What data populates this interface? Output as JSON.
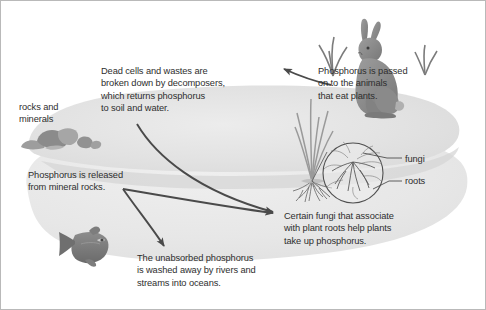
{
  "diagram": {
    "palette": {
      "text": "#2e2e2e",
      "arrow": "#4a4a4a",
      "land_light": "#e8e8e8",
      "land_mid": "#dedede",
      "land_dark": "#d2d2d2",
      "animal_gray": "#8e8e8e",
      "animal_dark": "#6f6f6f",
      "rock_gray": "#9a9a9a",
      "plant_gray": "#9e9e9e",
      "border": "#b9b9b9",
      "background": "#ffffff"
    },
    "labels": {
      "rocks_and_minerals": {
        "lines": [
          "rocks and",
          "minerals"
        ],
        "text": "rocks and\nminerals"
      },
      "decomposers": {
        "lines": [
          "Dead cells and wastes are",
          "broken down by decomposers,",
          "which returns phosphorus",
          "to soil and water."
        ],
        "text": "Dead cells and wastes are\nbroken down by decomposers,\nwhich returns phosphorus\nto soil and water."
      },
      "animals": {
        "lines": [
          "Phosphorus is passed",
          "on to the animals",
          "that eat plants."
        ],
        "text": "Phosphorus is passed\non to the animals\nthat eat plants."
      },
      "released_from_rocks": {
        "lines": [
          "Phosphorus is released",
          "from mineral rocks."
        ],
        "text": "Phosphorus is released\nfrom mineral rocks."
      },
      "fungi_association": {
        "lines": [
          "Certain fungi that associate",
          "with plant roots help plants",
          "take up phosphorus."
        ],
        "text": "Certain fungi that associate\nwith plant roots help plants\ntake up phosphorus."
      },
      "unabsorbed": {
        "lines": [
          "The unabsorbed phosphorus",
          "is washed away by rivers and",
          "streams into oceans."
        ],
        "text": "The unabsorbed phosphorus\nis washed away by rivers and\nstreams into oceans."
      },
      "callout_fungi": {
        "text": "fungi"
      },
      "callout_roots": {
        "text": "roots"
      }
    },
    "figures": [
      {
        "name": "rabbit",
        "label": "rabbit"
      },
      {
        "name": "fish",
        "label": "fish"
      },
      {
        "name": "rock-cluster",
        "label": "rocks"
      },
      {
        "name": "grass-plant",
        "label": "grass plant with roots"
      },
      {
        "name": "magnifier",
        "label": "root and fungi magnification circle"
      },
      {
        "name": "grass-tuft-left",
        "label": "grass tuft"
      },
      {
        "name": "grass-tuft-right",
        "label": "grass tuft"
      }
    ],
    "arrows": [
      {
        "name": "decomposers-to-roots",
        "from": "decomposers text",
        "to": "plant roots"
      },
      {
        "name": "rocks-to-roots",
        "from": "mineral rocks",
        "to": "plant roots"
      },
      {
        "name": "rocks-to-runoff",
        "from": "mineral rocks",
        "to": "rivers and streams"
      },
      {
        "name": "plants-to-animals",
        "from": "plants",
        "to": "rabbit"
      }
    ]
  }
}
